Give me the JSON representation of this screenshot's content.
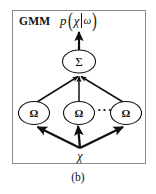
{
  "figure": {
    "caption": "(b)",
    "panel_label": "GMM",
    "formula": {
      "function": "p",
      "open_paren": "(",
      "argument": "χ",
      "separator": "|",
      "condition": "ω",
      "close_paren": ")",
      "plain": "p(χ|ω)"
    },
    "colors": {
      "frame": "#8b8b8b",
      "ink": "#101010",
      "background": "#ffffff"
    }
  },
  "graph": {
    "sum_node": {
      "symbol": "Σ",
      "name": "sigma-node"
    },
    "component_nodes": [
      {
        "symbol": "Ω",
        "name": "omega-node-1"
      },
      {
        "symbol": "Ω",
        "name": "omega-node-2"
      },
      {
        "symbol": "Ω",
        "name": "omega-node-3"
      }
    ],
    "ellipsis": "···",
    "input_node": {
      "symbol": "χ",
      "name": "chi-input"
    },
    "edges": [
      {
        "from": "chi-input",
        "to": "omega-node-1"
      },
      {
        "from": "chi-input",
        "to": "omega-node-2"
      },
      {
        "from": "chi-input",
        "to": "omega-node-3"
      },
      {
        "from": "omega-node-1",
        "to": "sigma-node"
      },
      {
        "from": "omega-node-2",
        "to": "sigma-node"
      },
      {
        "from": "omega-node-3",
        "to": "sigma-node"
      },
      {
        "from": "sigma-node",
        "to": "output"
      }
    ]
  }
}
